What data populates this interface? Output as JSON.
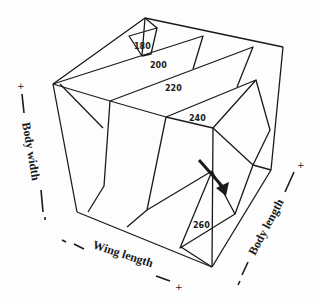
{
  "figure": {
    "type": "3d isosurface contour cube",
    "contour_levels": [
      {
        "value": "180"
      },
      {
        "value": "200"
      },
      {
        "value": "220"
      },
      {
        "value": "240"
      },
      {
        "value": "260"
      }
    ],
    "axes": {
      "body_width": {
        "label": "Body width",
        "plus": "+",
        "minus": "-"
      },
      "wing_length": {
        "label": "Wing length",
        "plus": "+",
        "minus": "-"
      },
      "body_length": {
        "label": "Body length",
        "plus": "+",
        "minus": "-"
      }
    },
    "annotation": {
      "arrow": "pointer-arrow",
      "color": "#1a1a1a"
    },
    "colors": {
      "ink": "#1a1a1a",
      "background": "#fdfdfd"
    }
  }
}
